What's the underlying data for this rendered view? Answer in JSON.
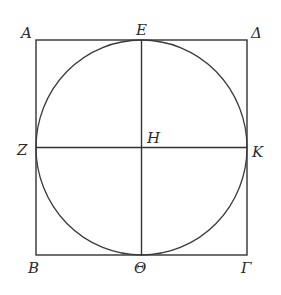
{
  "figure": {
    "type": "square-with-inscribed-circle",
    "square": {
      "x1": 36,
      "y1": 40,
      "x2": 247,
      "y2": 255
    },
    "circle": {
      "cx": 141.5,
      "cy": 147.5,
      "rx": 105.5,
      "ry": 107.5
    },
    "center": {
      "x": 141.5,
      "y": 147.5
    }
  },
  "labels": {
    "A": "A",
    "E": "E",
    "Delta": "Δ",
    "Z": "Z",
    "H": "H",
    "K": "K",
    "B": "B",
    "Theta": "Θ",
    "Gamma": "Γ"
  },
  "colors": {
    "line": "#333333",
    "text": "#2a2a2a",
    "background": "#ffffff"
  }
}
